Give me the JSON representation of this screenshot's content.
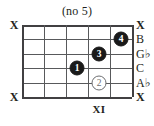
{
  "diagram": {
    "title": "(no 5)",
    "type": "guitar-chord-diagram",
    "orientation": "horizontal",
    "string_count": 6,
    "fret_count": 5,
    "position_label": "XI",
    "position_label_fret": 4,
    "colors": {
      "grid": "#58595b",
      "grid_edge": "#414042",
      "dot_filled": "#1a1a1a",
      "dot_open_outline": "#6d6e71",
      "text": "#231f20",
      "background": "#ffffff"
    }
  },
  "mute_markers": [
    {
      "name": "mute-x-string-1",
      "label": "X",
      "string": 1
    },
    {
      "name": "mute-x-string-6",
      "label": "X",
      "string": 6
    }
  ],
  "note_labels": [
    {
      "label": "X",
      "string": 1,
      "muted": true
    },
    {
      "label": "B",
      "string": 2,
      "muted": false
    },
    {
      "label": "G♭",
      "string": 3,
      "muted": false
    },
    {
      "label": "C",
      "string": 4,
      "muted": false
    },
    {
      "label": "A♭",
      "string": 5,
      "muted": false
    },
    {
      "label": "X",
      "string": 6,
      "muted": true
    }
  ],
  "finger_dots": [
    {
      "label": "1",
      "string": 4,
      "fret": 3,
      "style": "filled"
    },
    {
      "label": "2",
      "string": 5,
      "fret": 4,
      "style": "open"
    },
    {
      "label": "3",
      "string": 3,
      "fret": 4,
      "style": "filled"
    },
    {
      "label": "4",
      "string": 2,
      "fret": 5,
      "style": "filled"
    }
  ]
}
